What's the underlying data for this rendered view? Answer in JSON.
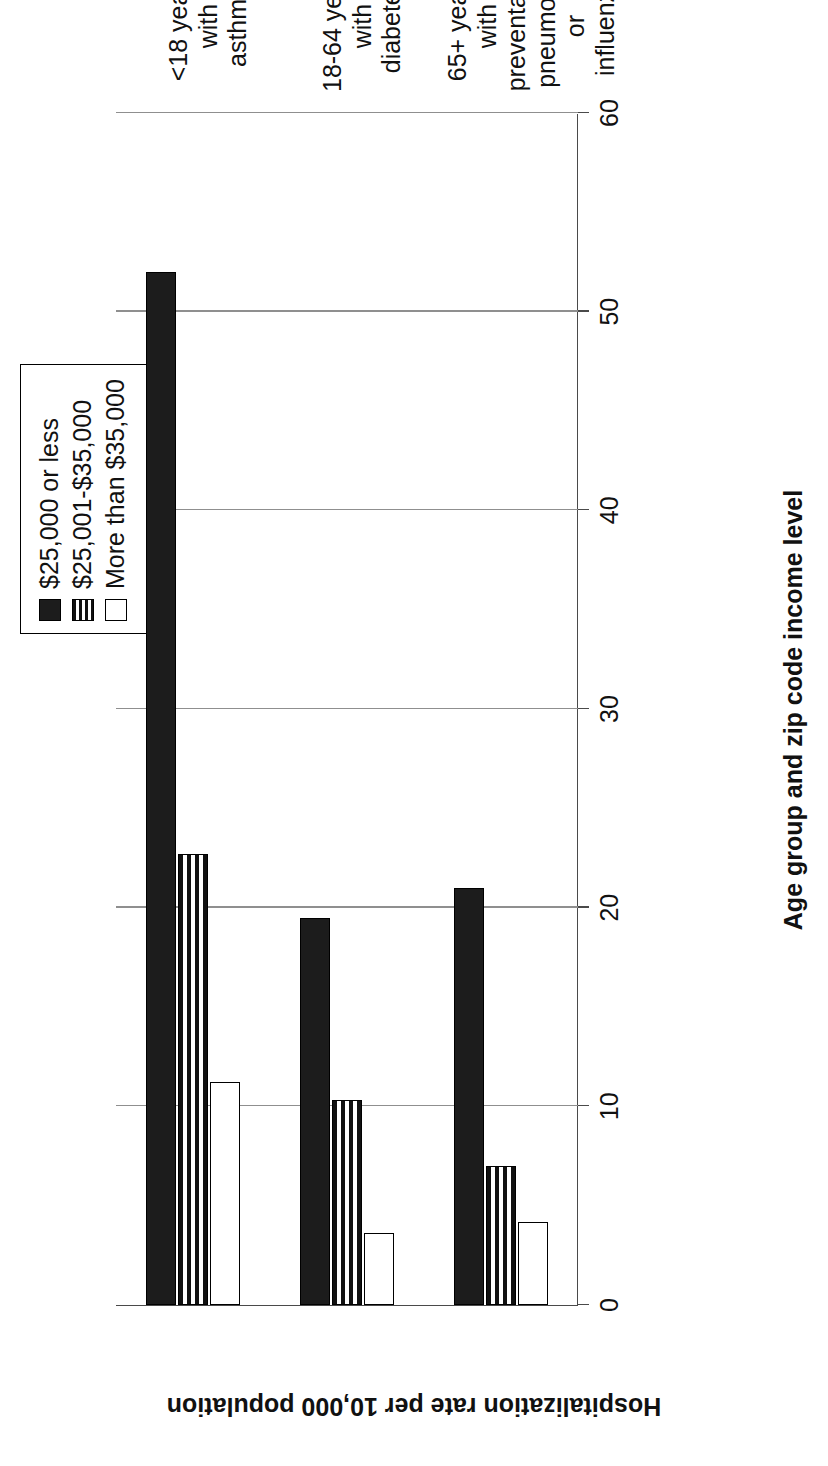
{
  "chart_data": {
    "type": "bar",
    "orientation": "vertical",
    "title": "",
    "xlabel": "Age group and zip code income level",
    "ylabel": "Hospitalization rate per 10,000 population",
    "ylim": [
      0,
      60
    ],
    "yticks": [
      "0",
      "10",
      "20",
      "30",
      "40",
      "50",
      "60"
    ],
    "ytick_values": [
      0,
      10,
      20,
      30,
      40,
      50,
      60
    ],
    "grid": true,
    "legend_position": "top-right",
    "categories": [
      "<18 years with asthma",
      "18-64 years with diabetes",
      "65+ years with preventable pneumonia or influenza"
    ],
    "category_lines": [
      [
        "<18 years with",
        "asthma"
      ],
      [
        "18-64 years with",
        "diabetes"
      ],
      [
        "65+ years with",
        "preventable",
        "pneumonia or",
        "influenza"
      ]
    ],
    "series": [
      {
        "name": "$25,000 or less",
        "pattern": "solid-black",
        "values": [
          52.0,
          19.5,
          21.0
        ]
      },
      {
        "name": "$25,001-$35,000",
        "pattern": "horizontal-lines",
        "values": [
          22.7,
          10.3,
          7.0
        ]
      },
      {
        "name": "More than $35,000",
        "pattern": "white-outline",
        "values": [
          11.2,
          3.6,
          4.2
        ]
      }
    ]
  },
  "legend": {
    "items": [
      {
        "label": "$25,000 or less"
      },
      {
        "label": "$25,001-$35,000"
      },
      {
        "label": "More than $35,000"
      }
    ]
  },
  "axes": {
    "value_axis_title": "Hospitalization rate per 10,000 population",
    "category_axis_title": "Age group and zip code income level"
  },
  "colors": {
    "series_1": "#1c1c1c",
    "series_2": "#111111",
    "series_3": "#ffffff",
    "axis": "#4a4a4a",
    "grid": "#8f8f8f",
    "text": "#111111",
    "background": "#ffffff"
  }
}
